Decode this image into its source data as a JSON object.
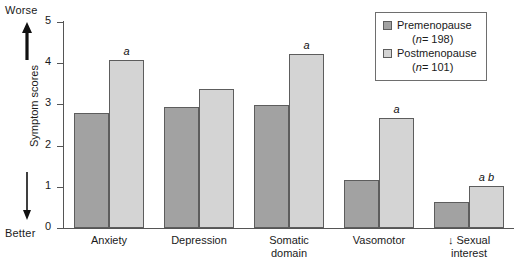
{
  "chart_data": {
    "type": "bar",
    "title": "",
    "xlabel": "",
    "ylabel": "Symptom scores",
    "ylim": [
      0,
      5
    ],
    "yticks": [
      0,
      1,
      2,
      3,
      4,
      5
    ],
    "grid": false,
    "legend_position": "top-right",
    "categories": [
      "Anxiety",
      "Depression",
      "Somatic\ndomain",
      "Vasomotor",
      "↓ Sexual interest"
    ],
    "series": [
      {
        "name": "Premenopause",
        "n_label": "(n = 198)",
        "color": "#a2a2a2",
        "values": [
          2.78,
          2.93,
          2.98,
          1.16,
          0.62
        ]
      },
      {
        "name": "Postmenopause",
        "n_label": "(n = 101)",
        "color": "#d4d4d4",
        "values": [
          4.08,
          3.37,
          4.22,
          2.68,
          1.03
        ]
      }
    ],
    "annotations": [
      {
        "category": "Anxiety",
        "series": "Postmenopause",
        "text": "a"
      },
      {
        "category": "Somatic domain",
        "series": "Postmenopause",
        "text": "a"
      },
      {
        "category": "Vasomotor",
        "series": "Postmenopause",
        "text": "a"
      },
      {
        "category": "↓ Sexual interest",
        "series": "Postmenopause",
        "text": "a b"
      }
    ],
    "direction_labels": {
      "top": "Worse",
      "bottom": "Better"
    }
  },
  "axis": {
    "y_title": "Symptom scores",
    "tick_labels": [
      "5",
      "4",
      "3",
      "2",
      "1",
      "0"
    ]
  },
  "direction": {
    "worse": "Worse",
    "better": "Better"
  },
  "legend": {
    "entries": [
      {
        "label": "Premenopause",
        "sub_n": "n",
        "sub_value": "= 198"
      },
      {
        "label": "Postmenopause",
        "sub_n": "n",
        "sub_value": "= 101"
      }
    ]
  },
  "xticks": [
    {
      "label": "Anxiety"
    },
    {
      "label": "Depression"
    },
    {
      "label": "Somatic\ndomain"
    },
    {
      "label": "Vasomotor"
    },
    {
      "label": "↓ Sexual interest"
    }
  ],
  "annotation_marks": [
    "a",
    "a",
    "a",
    "a b"
  ],
  "colors": {
    "premenopause": "#a2a2a2",
    "postmenopause": "#d4d4d4",
    "axis": "#555555",
    "bar_border": "#5d5d5d",
    "text": "#1a1a1a"
  }
}
